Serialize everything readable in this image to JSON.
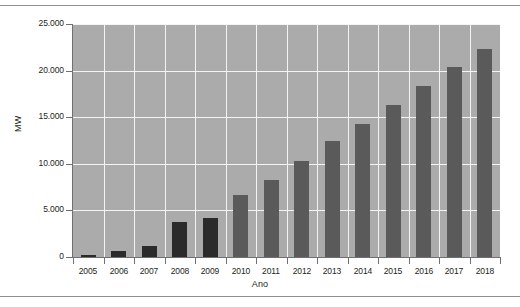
{
  "figure": {
    "background_color": "#ffffff",
    "plot_background_color": "#ababab",
    "gridline_color": "#f4f4f4",
    "axis_color": "#6f7072",
    "rule_color": "#8d8f91"
  },
  "chart_data": {
    "type": "bar",
    "title": "",
    "xlabel": "Ano",
    "ylabel": "MW",
    "ylim": [
      0,
      25000
    ],
    "ytick_labels": [
      "0",
      "5.000",
      "10.000",
      "15.000",
      "20.000",
      "25.000"
    ],
    "ytick_values": [
      0,
      5000,
      10000,
      15000,
      20000,
      25000
    ],
    "grid": "horizontal-and-vertical",
    "legend": "none",
    "categories": [
      "2005",
      "2006",
      "2007",
      "2008",
      "2009",
      "2010",
      "2011",
      "2012",
      "2013",
      "2014",
      "2015",
      "2016",
      "2017",
      "2018"
    ],
    "values": [
      250,
      650,
      1200,
      3800,
      4150,
      6650,
      8300,
      10350,
      12450,
      14300,
      16300,
      18400,
      20400,
      22300
    ],
    "bar_colors": [
      "#2b2b2b",
      "#2b2b2b",
      "#2b2b2b",
      "#2b2b2b",
      "#2b2b2b",
      "#5a5a5a",
      "#5a5a5a",
      "#5a5a5a",
      "#5a5a5a",
      "#5a5a5a",
      "#5a5a5a",
      "#5a5a5a",
      "#5a5a5a",
      "#5a5a5a"
    ],
    "series": [
      {
        "name": "MW",
        "values": [
          250,
          650,
          1200,
          3800,
          4150,
          6650,
          8300,
          10350,
          12450,
          14300,
          16300,
          18400,
          20400,
          22300
        ]
      }
    ]
  }
}
